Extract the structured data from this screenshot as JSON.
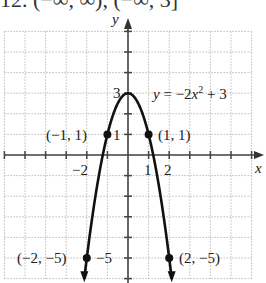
{
  "header_fragment": "12. (−∞, ∞), (−∞, 3]",
  "chart_data": {
    "type": "line",
    "title": "",
    "equation": "y = −2x² + 3",
    "equation_parts": {
      "prefix": "y = −2x",
      "exp": "2",
      "suffix": " + 3"
    },
    "xlabel": "x",
    "ylabel": "y",
    "xlim": [
      -6,
      6
    ],
    "ylim": [
      -6,
      6
    ],
    "grid": true,
    "grid_style": "dotted",
    "x_tick_labels": [
      {
        "value": -2,
        "label": "−2"
      },
      {
        "value": 1,
        "label": "1"
      },
      {
        "value": 2,
        "label": "2"
      }
    ],
    "y_tick_labels": [
      {
        "value": 3,
        "label": "3"
      },
      {
        "value": 1,
        "label": "1"
      },
      {
        "value": -5,
        "label": "−5"
      }
    ],
    "series": [
      {
        "name": "y = −2x² + 3",
        "function": "-2*x^2+3",
        "x_range": [
          -2.12,
          2.12
        ],
        "color": "#111111",
        "arrows_at_ends": true
      }
    ],
    "points": [
      {
        "x": -1,
        "y": 1,
        "label": "(−1, 1)"
      },
      {
        "x": 1,
        "y": 1,
        "label": "(1, 1)"
      },
      {
        "x": -2,
        "y": -5,
        "label": "(−2, −5)"
      },
      {
        "x": 2,
        "y": -5,
        "label": "(2, −5)"
      }
    ],
    "vertex": {
      "x": 0,
      "y": 3
    }
  },
  "colors": {
    "curve": "#111111",
    "axis": "#444444",
    "grid": "#bbbbbb",
    "text": "#222222"
  }
}
